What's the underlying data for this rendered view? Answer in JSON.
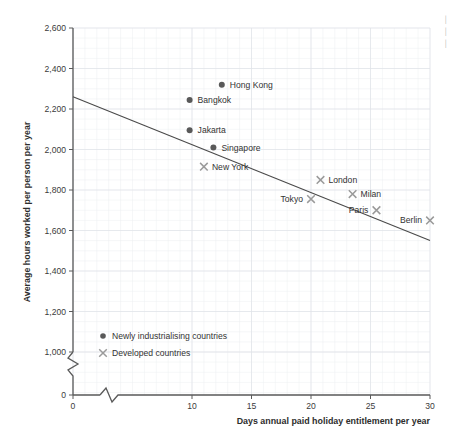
{
  "chart_data": {
    "type": "scatter",
    "title": "",
    "xlabel": "Days annual paid holiday entitlement per year",
    "ylabel": "Average hours worked per person per year",
    "xlim": [
      0,
      30
    ],
    "ylim": [
      0,
      2600
    ],
    "x_ticks": [
      "0",
      "10",
      "15",
      "20",
      "25",
      "30"
    ],
    "x_tick_values": [
      0,
      10,
      15,
      20,
      25,
      30
    ],
    "y_ticks": [
      "0",
      "1,000",
      "1,200",
      "1,400",
      "1,600",
      "1,800",
      "2,000",
      "2,200",
      "2,400",
      "2,600"
    ],
    "y_tick_values": [
      0,
      1000,
      1200,
      1400,
      1600,
      1800,
      2000,
      2200,
      2400,
      2600
    ],
    "grid": true,
    "axis_break_x": true,
    "axis_break_y": true,
    "legend_position": "inside-lower-left",
    "series": [
      {
        "name": "Newly industrialising countries",
        "marker": "dot",
        "color": "#595959",
        "points": [
          {
            "label": "Hong Kong",
            "x": 12.5,
            "y": 2320,
            "label_side": "right"
          },
          {
            "label": "Bangkok",
            "x": 9.8,
            "y": 2245,
            "label_side": "right"
          },
          {
            "label": "Jakarta",
            "x": 9.8,
            "y": 2095,
            "label_side": "right"
          },
          {
            "label": "Singapore",
            "x": 11.8,
            "y": 2010,
            "label_side": "right"
          }
        ]
      },
      {
        "name": "Developed countries",
        "marker": "x",
        "color": "#9a9a9a",
        "points": [
          {
            "label": "New York",
            "x": 11.0,
            "y": 1915,
            "label_side": "right"
          },
          {
            "label": "London",
            "x": 20.8,
            "y": 1850,
            "label_side": "right"
          },
          {
            "label": "Tokyo",
            "x": 20.0,
            "y": 1755,
            "label_side": "left"
          },
          {
            "label": "Milan",
            "x": 23.5,
            "y": 1780,
            "label_side": "right"
          },
          {
            "label": "Paris",
            "x": 25.5,
            "y": 1700,
            "label_side": "left"
          },
          {
            "label": "Berlin",
            "x": 30.0,
            "y": 1650,
            "label_side": "left"
          }
        ]
      }
    ],
    "trend_line": {
      "name": "line of best fit",
      "x_start": 0,
      "y_start": 2260,
      "x_end": 30,
      "y_end": 1550
    }
  },
  "legend": {
    "items": [
      {
        "marker": "dot",
        "label": "Newly industrialising countries"
      },
      {
        "marker": "x",
        "label": "Developed countries"
      }
    ]
  },
  "edge_text": {
    "fragments": [
      "│",
      "│",
      "│"
    ]
  }
}
